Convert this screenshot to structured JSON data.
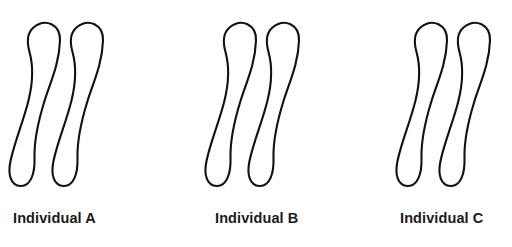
{
  "figure": {
    "background_color": "#ffffff",
    "stroke_color": "#111111",
    "fill_color": "#ffffff",
    "label_color": "#1a1a1a",
    "width": 512,
    "height": 247,
    "groups": [
      {
        "id": "individual-a",
        "label": "Individual A",
        "chromosome_count": 2,
        "chromosomes": [
          {
            "id": "a-chromosome-1",
            "name": "chromosome-outline"
          },
          {
            "id": "a-chromosome-2",
            "name": "chromosome-outline"
          }
        ]
      },
      {
        "id": "individual-b",
        "label": "Individual B",
        "chromosome_count": 2,
        "chromosomes": [
          {
            "id": "b-chromosome-1",
            "name": "chromosome-outline"
          },
          {
            "id": "b-chromosome-2",
            "name": "chromosome-outline"
          }
        ]
      },
      {
        "id": "individual-c",
        "label": "Individual C",
        "chromosome_count": 2,
        "chromosomes": [
          {
            "id": "c-chromosome-1",
            "name": "chromosome-outline"
          },
          {
            "id": "c-chromosome-2",
            "name": "chromosome-outline"
          }
        ]
      }
    ]
  }
}
